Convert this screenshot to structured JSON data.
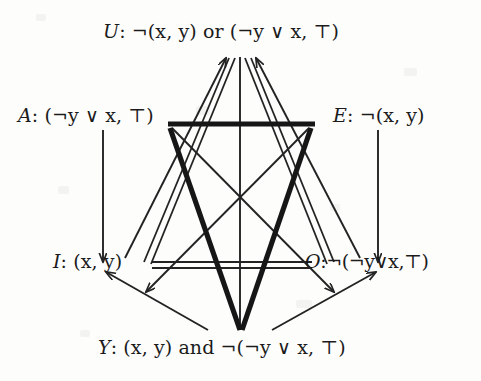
{
  "diagram": {
    "type": "hexagon-of-opposition",
    "title_visible": false,
    "vertices": [
      {
        "id": "U",
        "position": "top",
        "tag": "U",
        "separator": ":",
        "formula": "¬(x, y) or (¬y ∨ x, ⊤)",
        "full_label": "U: ¬(x, y) or (¬y ∨ x, ⊤)",
        "x": 240,
        "y": 45
      },
      {
        "id": "A",
        "position": "upper-left",
        "tag": "A",
        "separator": ":",
        "formula": "(¬y ∨ x, ⊤)",
        "full_label": "A: (¬y ∨ x, ⊤)",
        "x": 168,
        "y": 124
      },
      {
        "id": "E",
        "position": "upper-right",
        "tag": "E",
        "separator": ":",
        "formula": "¬(x, y)",
        "full_label": "E: ¬(x, y)",
        "x": 313,
        "y": 124
      },
      {
        "id": "I",
        "position": "lower-left",
        "tag": "I",
        "separator": ":",
        "formula": "(x, y)",
        "full_label": "I: (x, y)",
        "x": 152,
        "y": 264
      },
      {
        "id": "O",
        "position": "lower-right",
        "tag": "O",
        "separator": ":",
        "formula": "¬(¬y∨x,⊤)",
        "full_label": "O:¬(¬y∨x,⊤)",
        "x": 310,
        "y": 264
      },
      {
        "id": "Y",
        "position": "bottom",
        "tag": "Y",
        "separator": ":",
        "formula": "(x, y) and ¬(¬y ∨ x, ⊤)",
        "full_label": "Y: (x, y) and ¬(¬y ∨ x, ⊤)",
        "x": 240,
        "y": 345
      }
    ],
    "edges": [
      {
        "from": "A",
        "to": "E",
        "style": "thick",
        "relation": "contrariety"
      },
      {
        "from": "A",
        "to": "Y",
        "style": "thick",
        "relation": "contrariety"
      },
      {
        "from": "E",
        "to": "Y",
        "style": "thick",
        "relation": "contrariety"
      },
      {
        "from": "I",
        "to": "O",
        "style": "double",
        "relation": "subcontrariety"
      },
      {
        "from": "U",
        "to": "I",
        "style": "double",
        "relation": "subcontrariety"
      },
      {
        "from": "U",
        "to": "O",
        "style": "double",
        "relation": "subcontrariety"
      },
      {
        "from": "A",
        "to": "O",
        "style": "thin",
        "relation": "contradiction"
      },
      {
        "from": "E",
        "to": "I",
        "style": "thin",
        "relation": "contradiction"
      },
      {
        "from": "U",
        "to": "Y",
        "style": "thin",
        "relation": "contradiction"
      },
      {
        "from": "A",
        "to": "I",
        "style": "thin-arrow",
        "relation": "subalternation"
      },
      {
        "from": "E",
        "to": "O",
        "style": "thin-arrow",
        "relation": "subalternation"
      },
      {
        "from": "I",
        "to": "U",
        "style": "thin-arrow",
        "relation": "subalternation"
      },
      {
        "from": "O",
        "to": "U",
        "style": "thin-arrow",
        "relation": "subalternation"
      },
      {
        "from": "Y",
        "to": "I",
        "style": "thin-arrow",
        "relation": "subalternation"
      },
      {
        "from": "Y",
        "to": "O",
        "style": "thin-arrow",
        "relation": "subalternation"
      }
    ],
    "colors": {
      "ink": "#1b1b1b",
      "line": "#232323",
      "background": "#fdfdfc"
    }
  }
}
